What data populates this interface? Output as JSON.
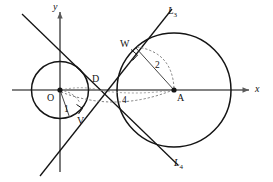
{
  "diagram": {
    "type": "geometry",
    "axes": {
      "x_label": "x",
      "y_label": "y",
      "origin_label": "O"
    },
    "points": [
      {
        "name": "O",
        "label": "O",
        "x": 0,
        "y": 0,
        "role": "center-small-circle",
        "dot": true
      },
      {
        "name": "A",
        "label": "A",
        "x": 4,
        "y": 0,
        "role": "center-large-circle",
        "dot": true
      },
      {
        "name": "D",
        "label": "D",
        "x": 1.33,
        "y": 0,
        "role": "tangent-lines-intersection",
        "dot": false
      },
      {
        "name": "V",
        "label": "V",
        "x": 0.33,
        "y": -0.94,
        "role": "tangency-point-small-circle",
        "dot": false
      },
      {
        "name": "W",
        "label": "W",
        "x": 2.67,
        "y": 1.89,
        "role": "tangency-point-large-circle",
        "dot": false
      }
    ],
    "circles": [
      {
        "name": "small-circle",
        "center": "O",
        "cx": 0,
        "cy": 0,
        "r": 1
      },
      {
        "name": "large-circle",
        "center": "A",
        "cx": 4,
        "cy": 0,
        "r": 2
      }
    ],
    "lines": [
      {
        "name": "tangent-line-upper",
        "label": "L",
        "subscript": "3"
      },
      {
        "name": "tangent-line-lower",
        "label": "L",
        "subscript": "4"
      }
    ],
    "measure_labels": [
      {
        "name": "radius-small",
        "text": "1",
        "describes": "OV"
      },
      {
        "name": "radius-large",
        "text": "2",
        "describes": "AW"
      },
      {
        "name": "center-distance",
        "text": "4",
        "describes": "OA"
      }
    ],
    "colors": {
      "stroke": "#141414",
      "axis": "#5a5a5a",
      "dashed": "#6e6e6e",
      "background": "#ffffff"
    }
  }
}
